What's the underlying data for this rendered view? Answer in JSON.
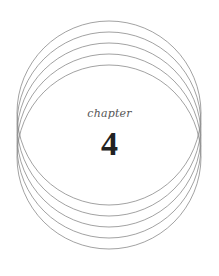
{
  "chapter": {
    "label": "chapter",
    "number": "4"
  },
  "ornament": {
    "type": "overlapping-circles",
    "count": 5,
    "stroke_color": "#8a8a8a",
    "center_x": 109,
    "radius": 92,
    "center_ys": [
      113,
      124,
      135,
      146,
      157
    ]
  }
}
